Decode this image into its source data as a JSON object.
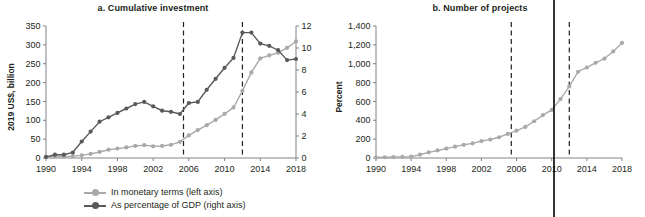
{
  "figure": {
    "panels": [
      {
        "key": "a",
        "title": "a. Cumulative investment",
        "ylabel_left": "2019 US$, billion",
        "ylabel_right": "Percent"
      },
      {
        "key": "b",
        "title": "b. Number of projects",
        "ylabel_left": ""
      }
    ]
  },
  "legend": {
    "items": [
      {
        "label": "In monetary terms (left axis)",
        "color": "#a7a9ac",
        "marker": "circle-line-marker"
      },
      {
        "label": "As percentage of GDP (right axis)",
        "color": "#58595b",
        "marker": "circle-line-marker"
      }
    ]
  },
  "axes_text": {
    "panel_a_y_left_ticks": [
      "0",
      "50",
      "100",
      "150",
      "200",
      "250",
      "300",
      "350"
    ],
    "panel_a_y_right_ticks": [
      "0",
      "2",
      "4",
      "6",
      "8",
      "10",
      "12"
    ],
    "panel_a_x_ticks": [
      "1990",
      "1994",
      "1998",
      "2002",
      "2006",
      "2010",
      "2014",
      "2018"
    ],
    "panel_b_y_ticks": [
      "0",
      "200",
      "400",
      "600",
      "800",
      "1,000",
      "1,200",
      "1,400"
    ],
    "panel_b_x_ticks": [
      "1990",
      "1994",
      "1998",
      "2002",
      "2006",
      "2010",
      "2014",
      "2018"
    ]
  },
  "chart_data": [
    {
      "type": "line",
      "panel": "a",
      "title": "a. Cumulative investment",
      "xlabel": "",
      "ylabel": "2019 US$, billion",
      "ylabel_secondary": "Percent",
      "xlim": [
        1990,
        2018
      ],
      "ylim": [
        0,
        350
      ],
      "ylim_secondary": [
        0,
        12
      ],
      "grid": false,
      "legend_position": "below-figure",
      "xticks": [
        1990,
        1994,
        1998,
        2002,
        2006,
        2010,
        2014,
        2018
      ],
      "yticks": [
        0,
        50,
        100,
        150,
        200,
        250,
        300,
        350
      ],
      "yticks_secondary": [
        0,
        2,
        4,
        6,
        8,
        10,
        12
      ],
      "x": [
        1990,
        1991,
        1992,
        1993,
        1994,
        1995,
        1996,
        1997,
        1998,
        1999,
        2000,
        2001,
        2002,
        2003,
        2004,
        2005,
        2006,
        2007,
        2008,
        2009,
        2010,
        2011,
        2012,
        2013,
        2014,
        2015,
        2016,
        2017,
        2018
      ],
      "series": [
        {
          "name": "In monetary terms (left axis)",
          "axis": "left",
          "color": "#a7a9ac",
          "units": "2019 US$, billion",
          "values": [
            2,
            4,
            4,
            5,
            7,
            11,
            16,
            22,
            25,
            28,
            32,
            34,
            31,
            32,
            35,
            43,
            60,
            74,
            87,
            101,
            117,
            134,
            178,
            227,
            264,
            272,
            279,
            292,
            309
          ]
        },
        {
          "name": "As percentage of GDP (right axis)",
          "axis": "right",
          "color": "#58595b",
          "units": "Percent",
          "values": [
            0.1,
            0.3,
            0.3,
            0.5,
            1.5,
            2.4,
            3.3,
            3.7,
            4.1,
            4.5,
            4.9,
            5.1,
            4.7,
            4.3,
            4.2,
            4.0,
            5.0,
            5.1,
            6.2,
            7.2,
            8.2,
            9.1,
            11.4,
            11.4,
            10.4,
            10.2,
            9.8,
            8.9,
            9.0
          ]
        }
      ],
      "annotations": [
        {
          "type": "vertical-dashed-line",
          "x": 2005.4
        },
        {
          "type": "vertical-dashed-line",
          "x": 2012.0
        }
      ]
    },
    {
      "type": "line",
      "panel": "b",
      "title": "b. Number of projects",
      "xlabel": "",
      "ylabel": "",
      "xlim": [
        1990,
        2018
      ],
      "ylim": [
        0,
        1400
      ],
      "grid": false,
      "legend_position": "shared-below-figure",
      "xticks": [
        1990,
        1994,
        1998,
        2002,
        2006,
        2010,
        2014,
        2018
      ],
      "yticks": [
        0,
        200,
        400,
        600,
        800,
        1000,
        1200,
        1400
      ],
      "x": [
        1990,
        1991,
        1992,
        1993,
        1994,
        1995,
        1996,
        1997,
        1998,
        1999,
        2000,
        2001,
        2002,
        2003,
        2004,
        2005,
        2006,
        2007,
        2008,
        2009,
        2010,
        2011,
        2012,
        2013,
        2014,
        2015,
        2016,
        2017,
        2018
      ],
      "series": [
        {
          "name": "Number of projects",
          "axis": "left",
          "color": "#a7a9ac",
          "units": "projects",
          "values": [
            5,
            8,
            10,
            12,
            15,
            35,
            60,
            80,
            100,
            120,
            140,
            155,
            180,
            195,
            220,
            255,
            290,
            330,
            390,
            455,
            510,
            625,
            760,
            915,
            960,
            1010,
            1055,
            1130,
            1220
          ]
        }
      ],
      "annotations": [
        {
          "type": "vertical-dashed-line",
          "x": 2005.4
        },
        {
          "type": "vertical-dashed-line",
          "x": 2012.0
        },
        {
          "type": "vertical-solid-page-divider",
          "x": 2010.1
        }
      ]
    }
  ]
}
